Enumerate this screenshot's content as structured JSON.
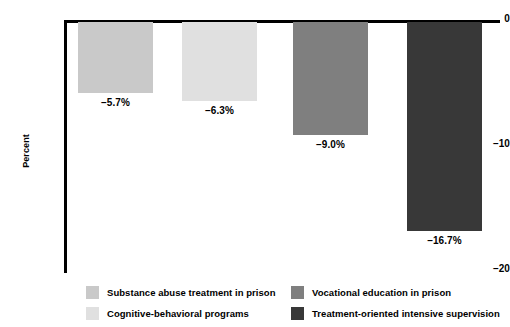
{
  "chart_data": {
    "type": "bar",
    "title": "",
    "xlabel": "",
    "ylabel": "Percent",
    "ylim": [
      -20,
      0
    ],
    "yticks": [
      0,
      -10,
      -20
    ],
    "ytick_labels": [
      "0",
      "–10",
      "–20"
    ],
    "grid": false,
    "orientation": "vertical",
    "legend_position": "bottom",
    "categories": [
      "Substance abuse treatment in prison",
      "Cognitive-behavioral programs",
      "Vocational education in prison",
      "Treatment-oriented intensive supervision"
    ],
    "values": [
      -5.7,
      -6.3,
      -9.0,
      -16.7
    ],
    "value_labels": [
      "–5.7%",
      "–6.3%",
      "–9.0%",
      "–16.7%"
    ],
    "colors": [
      "#c9c9c9",
      "#e0e0e0",
      "#7f7f7f",
      "#383838"
    ]
  },
  "axis": {
    "y_title": "Percent",
    "ticks": [
      {
        "label": "0"
      },
      {
        "label": "–10"
      },
      {
        "label": "–20"
      }
    ]
  },
  "legend": {
    "items": [
      {
        "label": "Substance abuse treatment in prison",
        "color": "#c9c9c9"
      },
      {
        "label": "Vocational education in prison",
        "color": "#7f7f7f"
      },
      {
        "label": "Cognitive-behavioral programs",
        "color": "#e0e0e0"
      },
      {
        "label": "Treatment-oriented intensive supervision",
        "color": "#383838"
      }
    ]
  }
}
